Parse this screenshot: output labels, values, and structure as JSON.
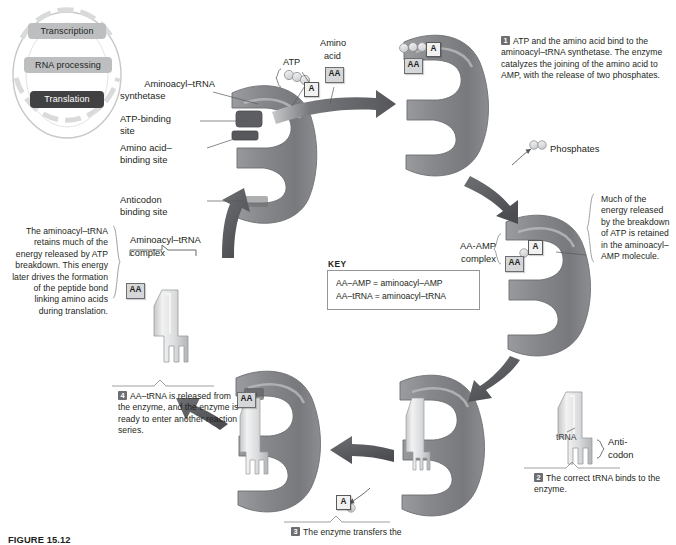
{
  "figure": {
    "caption": "FIGURE 15.12"
  },
  "cycle_key": {
    "items": [
      {
        "label": "Transcription",
        "state": "inactive"
      },
      {
        "label": "RNA processing",
        "state": "inactive"
      },
      {
        "label": "Translation",
        "state": "active"
      }
    ]
  },
  "enzyme_labels": {
    "synthetase": "Aminoacyl–tRNA\nsynthetase",
    "synthetase_l1": "Aminoacyl–tRNA",
    "synthetase_l2": "synthetase",
    "atp_site_l1": "ATP-binding",
    "atp_site_l2": "site",
    "aa_site_l1": "Amino acid–",
    "aa_site_l2": "binding site",
    "anticodon_site_l1": "Anticodon",
    "anticodon_site_l2": "binding site"
  },
  "molecules": {
    "atp": "ATP",
    "amino_acid_l1": "Amino",
    "amino_acid_l2": "acid",
    "aa_tag": "AA",
    "a_tag": "A",
    "phosphates": "Phosphates",
    "aa_amp_complex_l1": "AA-AMP",
    "aa_amp_complex_l2": "complex",
    "aminoacyl_trna_complex_l1": "Aminoacyl–tRNA",
    "aminoacyl_trna_complex_l2": "complex",
    "trna": "tRNA",
    "anticodon_l1": "Anti-",
    "anticodon_l2": "codon"
  },
  "steps": [
    {
      "num": "1",
      "text": "ATP and the amino acid bind to the aminoacyl–tRNA synthetase. The enzyme catalyzes the joining of the amino acid to AMP, with the release of two phosphates."
    },
    {
      "num": "2",
      "text": "The correct tRNA binds to the enzyme."
    },
    {
      "num": "3",
      "text": "The enzyme transfers the"
    },
    {
      "num": "4",
      "text": "AA–tRNA is released from the enzyme, and the enzyme is ready to enter another reaction series."
    }
  ],
  "annotations": {
    "energy_right": "Much of the energy released by the breakdown of ATP is retained in the aminoacyl–AMP molecule.",
    "energy_left": "The aminoacyl–tRNA retains much of the energy released by ATP breakdown. This energy later drives the formation of the peptide bond linking amino acids during translation."
  },
  "key": {
    "title": "KEY",
    "lines": [
      "AA–AMP = aminoacyl–AMP",
      "AA–tRNA = aminoacyl–tRNA"
    ]
  },
  "colors": {
    "enzyme_fill": "#808285",
    "enzyme_light": "#a7a9ac",
    "arrow": "#58595b",
    "text": "#231f20",
    "tag_bg": "#d6d7d8",
    "active_pill": "#414042",
    "inactive_pill": "#bcbec0"
  }
}
